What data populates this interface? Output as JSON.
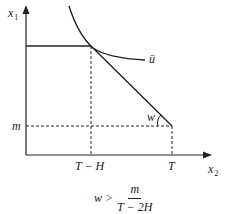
{
  "diagram": {
    "axes": {
      "y_label": "x",
      "y_label_sub": "1",
      "x_label": "x",
      "x_label_sub": "2"
    },
    "ticks": {
      "x": [
        "T − H",
        "T"
      ],
      "y": [
        "m"
      ]
    },
    "curve_label": "ū",
    "angle_label": "w",
    "condition": {
      "lhs": "w >",
      "numerator": "m",
      "denominator": "T − 2H"
    }
  }
}
